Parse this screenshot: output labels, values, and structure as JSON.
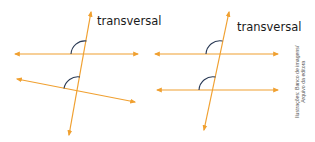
{
  "figures": [
    {
      "id": "non-parallel",
      "label": "transversal",
      "lines": {
        "line_a": {
          "x1": 15,
          "y1": 54,
          "x2": 138,
          "y2": 54
        },
        "line_b": {
          "x1": 17,
          "y1": 79,
          "x2": 135,
          "y2": 102
        },
        "transversal": {
          "x1": 91,
          "y1": 12,
          "x2": 69,
          "y2": 135
        }
      }
    },
    {
      "id": "parallel",
      "label": "transversal",
      "lines": {
        "line_a": {
          "x1": 155,
          "y1": 54,
          "x2": 278,
          "y2": 54
        },
        "line_b": {
          "x1": 157,
          "y1": 90,
          "x2": 278,
          "y2": 90
        },
        "transversal": {
          "x1": 229,
          "y1": 12,
          "x2": 204,
          "y2": 130
        }
      }
    }
  ],
  "credit": {
    "line1": "Ilustrações: Banco de imagens/",
    "line2": "Arquivo da editora"
  },
  "colors": {
    "line": "#f0a030",
    "angle_arc": "#2a3a55",
    "text": "#1a1a1a"
  }
}
